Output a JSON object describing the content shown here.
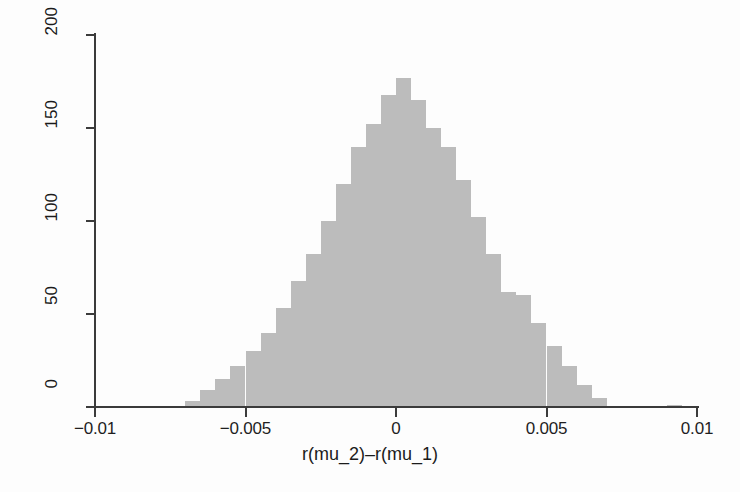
{
  "figure": {
    "background": "#fdfdfd",
    "bar_color": "#bcbcbc",
    "axis_color": "#3b3b3b"
  },
  "chart_data": {
    "type": "bar",
    "subtype": "histogram",
    "title": "",
    "xlabel": "r(mu_2)–r(mu_1)",
    "ylabel": "Density",
    "xlim": [
      -0.01,
      0.01
    ],
    "ylim": [
      0,
      200
    ],
    "xticks": [
      -0.01,
      -0.005,
      0,
      0.005,
      0.01
    ],
    "xticklabels": [
      "−0.01",
      "−0.005",
      "0",
      "0.005",
      "0.01"
    ],
    "yticks": [
      0,
      50,
      100,
      150,
      200
    ],
    "yticklabels": [
      "0",
      "50",
      "100",
      "150",
      "200"
    ],
    "grid": false,
    "legend": null,
    "bin_width": 0.0005,
    "bin_left_edges": [
      -0.007,
      -0.0065,
      -0.006,
      -0.0055,
      -0.005,
      -0.0045,
      -0.004,
      -0.0035,
      -0.003,
      -0.0025,
      -0.002,
      -0.0015,
      -0.001,
      -0.0005,
      0.0,
      0.0005,
      0.001,
      0.0015,
      0.002,
      0.0025,
      0.003,
      0.0035,
      0.004,
      0.0045,
      0.005,
      0.0055,
      0.006,
      0.0065,
      0.009
    ],
    "categories": [
      "-0.0070",
      "-0.0065",
      "-0.0060",
      "-0.0055",
      "-0.0050",
      "-0.0045",
      "-0.0040",
      "-0.0035",
      "-0.0030",
      "-0.0025",
      "-0.0020",
      "-0.0015",
      "-0.0010",
      "-0.0005",
      "0.0000",
      "0.0005",
      "0.0010",
      "0.0015",
      "0.0020",
      "0.0025",
      "0.0030",
      "0.0035",
      "0.0040",
      "0.0045",
      "0.0050",
      "0.0055",
      "0.0060",
      "0.0065",
      "0.0090"
    ],
    "values": [
      3,
      9,
      15,
      22,
      30,
      40,
      53,
      68,
      82,
      100,
      120,
      140,
      152,
      168,
      177,
      165,
      150,
      140,
      122,
      102,
      82,
      62,
      60,
      45,
      33,
      22,
      12,
      5,
      1
    ],
    "bars": [
      {
        "x": -0.007,
        "width": 0.0005,
        "value": 3
      },
      {
        "x": -0.0065,
        "width": 0.0005,
        "value": 9
      },
      {
        "x": -0.006,
        "width": 0.0005,
        "value": 15
      },
      {
        "x": -0.0055,
        "width": 0.0005,
        "value": 22
      },
      {
        "x": -0.005,
        "width": 0.0005,
        "value": 30
      },
      {
        "x": -0.0045,
        "width": 0.0005,
        "value": 40
      },
      {
        "x": -0.004,
        "width": 0.0005,
        "value": 53
      },
      {
        "x": -0.0035,
        "width": 0.0005,
        "value": 68
      },
      {
        "x": -0.003,
        "width": 0.0005,
        "value": 82
      },
      {
        "x": -0.0025,
        "width": 0.0005,
        "value": 100
      },
      {
        "x": -0.002,
        "width": 0.0005,
        "value": 120
      },
      {
        "x": -0.0015,
        "width": 0.0005,
        "value": 140
      },
      {
        "x": -0.001,
        "width": 0.0005,
        "value": 152
      },
      {
        "x": -0.0005,
        "width": 0.0005,
        "value": 168
      },
      {
        "x": 0.0,
        "width": 0.0005,
        "value": 177
      },
      {
        "x": 0.0005,
        "width": 0.0005,
        "value": 165
      },
      {
        "x": 0.001,
        "width": 0.0005,
        "value": 150
      },
      {
        "x": 0.0015,
        "width": 0.0005,
        "value": 140
      },
      {
        "x": 0.002,
        "width": 0.0005,
        "value": 122
      },
      {
        "x": 0.0025,
        "width": 0.0005,
        "value": 102
      },
      {
        "x": 0.003,
        "width": 0.0005,
        "value": 82
      },
      {
        "x": 0.0035,
        "width": 0.0005,
        "value": 62
      },
      {
        "x": 0.004,
        "width": 0.0005,
        "value": 60
      },
      {
        "x": 0.0045,
        "width": 0.0005,
        "value": 45
      },
      {
        "x": 0.005,
        "width": 0.0005,
        "value": 33
      },
      {
        "x": 0.0055,
        "width": 0.0005,
        "value": 22
      },
      {
        "x": 0.006,
        "width": 0.0005,
        "value": 12
      },
      {
        "x": 0.0065,
        "width": 0.0005,
        "value": 5
      },
      {
        "x": 0.009,
        "width": 0.0005,
        "value": 1
      }
    ]
  }
}
